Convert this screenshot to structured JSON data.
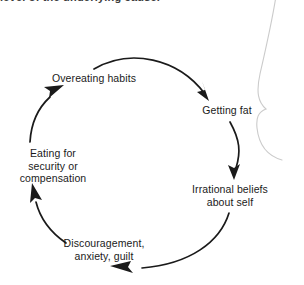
{
  "page": {
    "width": 304,
    "height": 285,
    "background": "#ffffff",
    "ink_color": "#1a1a1a",
    "artifact_color": "#c9c9c9"
  },
  "heading": {
    "text": "level of the underlying cause.",
    "note": "clipped at top edge of image"
  },
  "diagram": {
    "type": "cycle",
    "direction": "clockwise",
    "node_count": 5,
    "arrow_count": 5,
    "nodes": [
      {
        "id": "overeating",
        "label": "Overeating habits",
        "x": 94,
        "y": 78
      },
      {
        "id": "getting-fat",
        "label": "Getting fat",
        "x": 227,
        "y": 110
      },
      {
        "id": "irrational",
        "label": "Irrational beliefs\nabout self",
        "x": 230,
        "y": 195
      },
      {
        "id": "discouragement",
        "label": "Discouragement,\nanxiety, guilt",
        "x": 104,
        "y": 249
      },
      {
        "id": "eating-for",
        "label": "Eating for\nsecurity or\ncompensation",
        "x": 53,
        "y": 165
      }
    ],
    "edges": [
      {
        "from": "overeating",
        "to": "getting-fat"
      },
      {
        "from": "getting-fat",
        "to": "irrational"
      },
      {
        "from": "irrational",
        "to": "discouragement"
      },
      {
        "from": "discouragement",
        "to": "eating-for"
      },
      {
        "from": "eating-for",
        "to": "overeating"
      }
    ]
  },
  "artifact": {
    "name": "page-edge-curve",
    "description": "faint gray scan artifact curve along right margin"
  }
}
